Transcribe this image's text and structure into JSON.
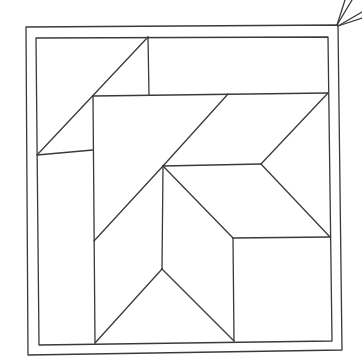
{
  "diagram": {
    "type": "line-drawing",
    "stroke_color": "#3a3a3a",
    "background_color": "#ffffff",
    "outer_frame": [
      [
        26,
        27
      ],
      [
        338,
        25
      ],
      [
        342,
        350
      ],
      [
        28,
        355
      ]
    ],
    "inner_frame": [
      [
        36,
        38
      ],
      [
        328,
        37
      ],
      [
        332,
        341
      ],
      [
        39,
        345
      ]
    ],
    "hanging_strings": [
      [
        [
          337,
          25
        ],
        [
          345,
          0
        ]
      ],
      [
        [
          337,
          25
        ],
        [
          352,
          0
        ]
      ],
      [
        [
          338,
          26
        ],
        [
          362,
          12
        ]
      ],
      [
        [
          338,
          26
        ],
        [
          362,
          18
        ]
      ]
    ],
    "segments": [
      [
        [
          148,
          37
        ],
        [
          149,
          95
        ]
      ],
      [
        [
          93,
          96
        ],
        [
          328,
          93
        ]
      ],
      [
        [
          148,
          37
        ],
        [
          37,
          155
        ]
      ],
      [
        [
          37,
          155
        ],
        [
          93,
          150
        ]
      ],
      [
        [
          93,
          96
        ],
        [
          95,
          343
        ]
      ],
      [
        [
          228,
          94
        ],
        [
          163,
          166
        ]
      ],
      [
        [
          328,
          93
        ],
        [
          261,
          164
        ]
      ],
      [
        [
          163,
          166
        ],
        [
          261,
          164
        ]
      ],
      [
        [
          261,
          164
        ],
        [
          330,
          237
        ]
      ],
      [
        [
          163,
          166
        ],
        [
          233,
          238
        ]
      ],
      [
        [
          233,
          238
        ],
        [
          330,
          237
        ]
      ],
      [
        [
          233,
          238
        ],
        [
          234,
          341
        ]
      ],
      [
        [
          163,
          166
        ],
        [
          94,
          241
        ]
      ],
      [
        [
          163,
          166
        ],
        [
          162,
          269
        ]
      ],
      [
        [
          162,
          269
        ],
        [
          95,
          343
        ]
      ],
      [
        [
          162,
          269
        ],
        [
          234,
          341
        ]
      ]
    ]
  }
}
